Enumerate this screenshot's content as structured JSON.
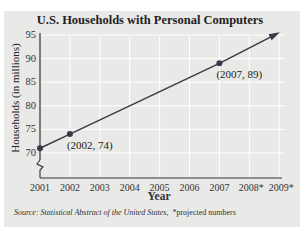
{
  "top_cut_text": "t       t    t    t        t        t       t    t",
  "chart_data": {
    "type": "line",
    "title": "U.S. Households with Personal Computers",
    "xlabel": "Year",
    "ylabel": "Households (in millions)",
    "x_tick_labels": [
      "2001",
      "2002",
      "2003",
      "2004",
      "2005",
      "2006",
      "2007",
      "2008*",
      "2009*"
    ],
    "y_tick_labels": [
      "70",
      "75",
      "80",
      "85",
      "90",
      "95"
    ],
    "ylim": [
      70,
      95
    ],
    "y_axis_break": true,
    "grid": true,
    "points": [
      {
        "x": 2001,
        "y": 71,
        "label": ""
      },
      {
        "x": 2002,
        "y": 74,
        "label": "(2002, 74)"
      },
      {
        "x": 2007,
        "y": 89,
        "label": "(2007, 89)"
      }
    ],
    "trend_extends_with_arrow_to": 2009,
    "annotations": [
      "(2002, 74)",
      "(2007, 89)"
    ]
  },
  "footer": {
    "source_label": "Source:",
    "source_text": "Statistical Abstract of the United States,",
    "note": "*projected numbers"
  }
}
